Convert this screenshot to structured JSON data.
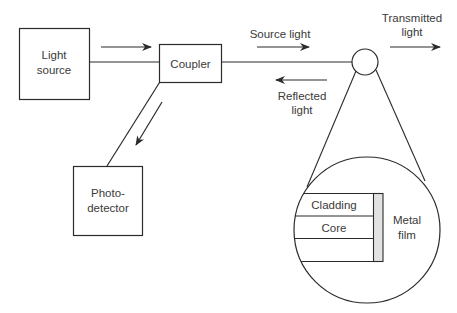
{
  "colors": {
    "stroke": "#2b2b2b",
    "text": "#3a3a3a",
    "metal_film_fill": "#e2e2e2",
    "background": "#ffffff"
  },
  "blocks": {
    "light_source": {
      "line1": "Light",
      "line2": "source"
    },
    "coupler": {
      "label": "Coupler"
    },
    "photodetector": {
      "line1": "Photo-",
      "line2": "detector"
    }
  },
  "signals": {
    "source_light": "Source light",
    "reflected_light": {
      "line1": "Reflected",
      "line2": "light"
    },
    "transmitted_light": {
      "line1": "Transmitted",
      "line2": "light"
    }
  },
  "detail_view": {
    "layers": [
      {
        "name": "cladding",
        "label": "Cladding"
      },
      {
        "name": "core",
        "label": "Core"
      },
      {
        "name": "cladding-lower",
        "label": ""
      }
    ],
    "metal_film": {
      "line1": "Metal",
      "line2": "film"
    }
  }
}
